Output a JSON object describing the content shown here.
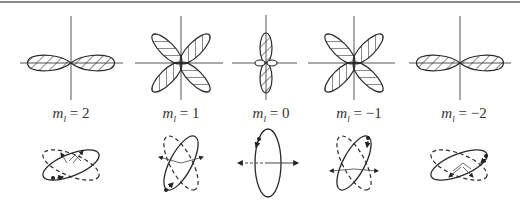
{
  "figure": {
    "panels": [
      {
        "id": "m2",
        "label_var": "m",
        "label_sub": "l",
        "label_eq": "= 2",
        "ml": 2,
        "center_x": 71,
        "lobe_pattern": "horizontal-pair",
        "orbit_tilt": -22
      },
      {
        "id": "m1",
        "label_var": "m",
        "label_sub": "l",
        "label_eq": "= 1",
        "ml": 1,
        "center_x": 181,
        "lobe_pattern": "four-diagonal",
        "orbit_tilt": -62
      },
      {
        "id": "m0",
        "label_var": "m",
        "label_sub": "l",
        "label_eq": "= 0",
        "ml": 0,
        "center_x": 268,
        "lobe_pattern": "vertical-pair-with-ring",
        "orbit_tilt": 90
      },
      {
        "id": "m-1",
        "label_var": "m",
        "label_sub": "l",
        "label_eq": "= −1",
        "ml": -1,
        "center_x": 354,
        "lobe_pattern": "four-diagonal",
        "orbit_tilt": -62
      },
      {
        "id": "m-2",
        "label_var": "m",
        "label_sub": "l",
        "label_eq": "= −2",
        "ml": -2,
        "center_x": 459,
        "lobe_pattern": "horizontal-pair",
        "orbit_tilt": -22
      }
    ],
    "colors": {
      "stroke": "#2a2a2a",
      "axis": "#555555",
      "rule": "#8a8a8a",
      "background": "#ffffff"
    }
  }
}
